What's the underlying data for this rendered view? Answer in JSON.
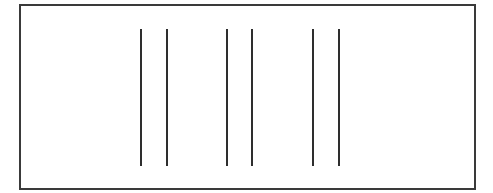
{
  "diagram": {
    "frame": {
      "x": 19,
      "y": 4,
      "width": 457,
      "height": 186,
      "color": "#3a3a3a"
    },
    "line_color": "#2e2e2e",
    "line_top": 29,
    "line_bottom": 166,
    "line_pairs": [
      {
        "left_x": 140,
        "right_x": 166
      },
      {
        "left_x": 226,
        "right_x": 251
      },
      {
        "left_x": 312,
        "right_x": 338
      }
    ]
  }
}
